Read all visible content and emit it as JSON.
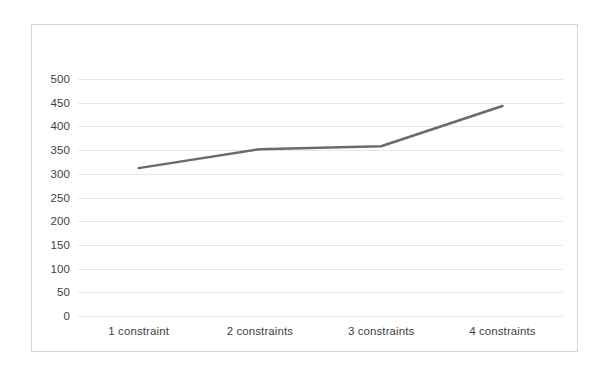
{
  "chart_data": {
    "type": "line",
    "title": "",
    "subtitle": "",
    "xlabel": "",
    "ylabel": "",
    "categories": [
      "1 constraint",
      "2 constraints",
      "3 constraints",
      "4 constraints"
    ],
    "series": [
      {
        "name": "",
        "values": [
          312,
          352,
          358,
          443
        ],
        "color": "#6b6b6b",
        "line_width": 2.5,
        "markers": false
      }
    ],
    "ylim": [
      0,
      500
    ],
    "ytick_values": [
      0,
      50,
      100,
      150,
      200,
      250,
      300,
      350,
      400,
      450,
      500
    ],
    "ytick_labels": [
      "0",
      "50",
      "100",
      "150",
      "200",
      "250",
      "300",
      "350",
      "400",
      "450",
      "500"
    ],
    "grid": {
      "horizontal": true,
      "vertical": false,
      "color": "#e6e6e6"
    },
    "legend": {
      "visible": false,
      "position": "none",
      "entries": []
    },
    "annotations": [],
    "axis_label_color": "#3f3f3f",
    "plot_background": "#ffffff",
    "border_color": "#d4d4d4"
  }
}
